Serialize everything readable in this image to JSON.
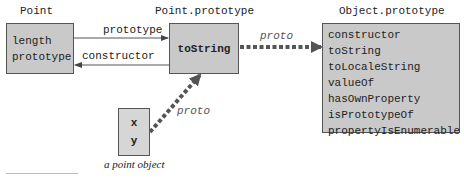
{
  "diagram": {
    "nodes": {
      "point": {
        "title": "Point",
        "items": [
          "length",
          "prototype"
        ]
      },
      "point_prototype": {
        "title": "Point.prototype",
        "items": [
          "toString"
        ]
      },
      "object_prototype": {
        "title": "Object.prototype",
        "items": [
          "constructor",
          "toString",
          "toLocaleString",
          "valueOf",
          "hasOwnProperty",
          "isPrototypeOf",
          "propertyIsEnumerable"
        ]
      },
      "point_object": {
        "caption": "a point object",
        "items": [
          "x",
          "y"
        ]
      }
    },
    "edges": {
      "prototype": "prototype",
      "constructor": "constructor",
      "proto_top": "proto",
      "proto_bottom": "proto"
    },
    "colors": {
      "box_fill": "#c9c9c9",
      "box_border": "#555555",
      "arrow": "#555555"
    }
  }
}
